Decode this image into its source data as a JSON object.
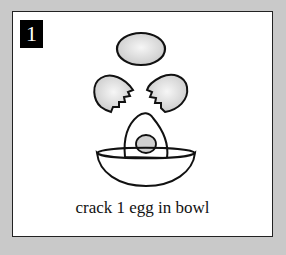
{
  "step": {
    "number": "1"
  },
  "caption": "crack 1 egg in bowl",
  "illustration": {
    "items": [
      "whole-egg",
      "cracked-shell-left",
      "cracked-shell-right",
      "egg-yolk",
      "bowl"
    ]
  },
  "colors": {
    "background": "#c9c9c9",
    "card": "#ffffff",
    "ink": "#111111",
    "shade": "#d8d8d8"
  }
}
